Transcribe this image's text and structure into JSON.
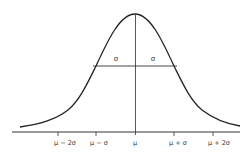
{
  "diagram": {
    "type": "normal-distribution-curve",
    "sigma_labels": [
      "σ",
      "σ"
    ],
    "x_ticks": [
      {
        "label": "μ − 2σ",
        "x": 58
      },
      {
        "label": "μ − σ",
        "x": 96
      },
      {
        "label": "μ",
        "x": 135
      },
      {
        "label": "μ + σ",
        "x": 174
      },
      {
        "label": "μ + 2σ",
        "x": 213
      }
    ],
    "colors": {
      "curve": "#222222",
      "axis": "#333333",
      "text": "#333333"
    }
  }
}
